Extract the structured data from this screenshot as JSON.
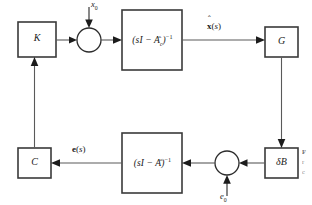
{
  "diagram": {
    "type": "control-block-diagram",
    "blocks": [
      {
        "id": "K",
        "label": "K",
        "shape": "rect",
        "x": 18,
        "y": 22,
        "w": 38,
        "h": 35
      },
      {
        "id": "sum_top",
        "label": "",
        "shape": "circle",
        "cx": 89,
        "cy": 40,
        "r": 12
      },
      {
        "id": "tf_top",
        "label": "(sI - Ac)^-1",
        "shape": "rect",
        "x": 122,
        "y": 10,
        "w": 60,
        "h": 60
      },
      {
        "id": "G",
        "label": "G",
        "shape": "rect",
        "x": 265,
        "y": 27,
        "w": 33,
        "h": 30
      },
      {
        "id": "dB",
        "label": "dB",
        "shape": "rect",
        "x": 265,
        "y": 148,
        "w": 33,
        "h": 30
      },
      {
        "id": "sum_bot",
        "label": "",
        "shape": "circle",
        "cx": 227,
        "cy": 163,
        "r": 12
      },
      {
        "id": "tf_bot",
        "label": "(sI - A)^-1",
        "shape": "rect",
        "x": 122,
        "y": 133,
        "w": 60,
        "h": 60
      },
      {
        "id": "C",
        "label": "C",
        "shape": "rect",
        "x": 18,
        "y": 148,
        "w": 33,
        "h": 30
      }
    ],
    "block_labels": {
      "gain_k": "K",
      "gain_c": "C",
      "gain_g": "G",
      "delta_b": "δB",
      "tf_top_base": "(sI − A",
      "tf_top_sub": "c",
      "tf_top_close": ")",
      "tf_top_exp": "−1",
      "tf_bot_base": "(sI − A",
      "tf_bot_close": ")",
      "tf_bot_exp": "−1"
    },
    "signals": {
      "x_hat_init_base": "x",
      "x_hat_init_sub": "0",
      "x_hat_s_bold": "x",
      "x_hat_s_paren_open": "(",
      "x_hat_s_arg": "s",
      "x_hat_s_paren_close": ")",
      "e_s_bold": "e",
      "e_s_paren_open": "(",
      "e_s_arg": "s",
      "e_s_paren_close": ")",
      "e_init_base": "e",
      "e_init_sub": "0",
      "hat_mark": "ˆ"
    },
    "caption_fragment": {
      "line1": "F",
      "line2": "r",
      "line3": "c"
    },
    "colors": {
      "background": "#ffffff",
      "block_stroke": "#3a3a3a",
      "wire": "#5a5a5a",
      "arrow": "#1c1c1c",
      "text": "#1a1a1a",
      "caption": "#8d8d8d"
    }
  }
}
